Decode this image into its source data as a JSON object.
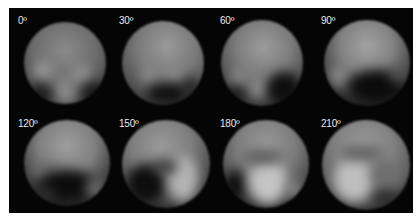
{
  "frames": [
    {
      "label": "0º"
    },
    {
      "label": "30º"
    },
    {
      "label": "60º"
    },
    {
      "label": "90º"
    },
    {
      "label": "120º"
    },
    {
      "label": "150º"
    },
    {
      "label": "180º"
    },
    {
      "label": "210º"
    }
  ],
  "colors": {
    "background": "#050505",
    "label": "#e8e8e8",
    "page": "#ffffff"
  }
}
